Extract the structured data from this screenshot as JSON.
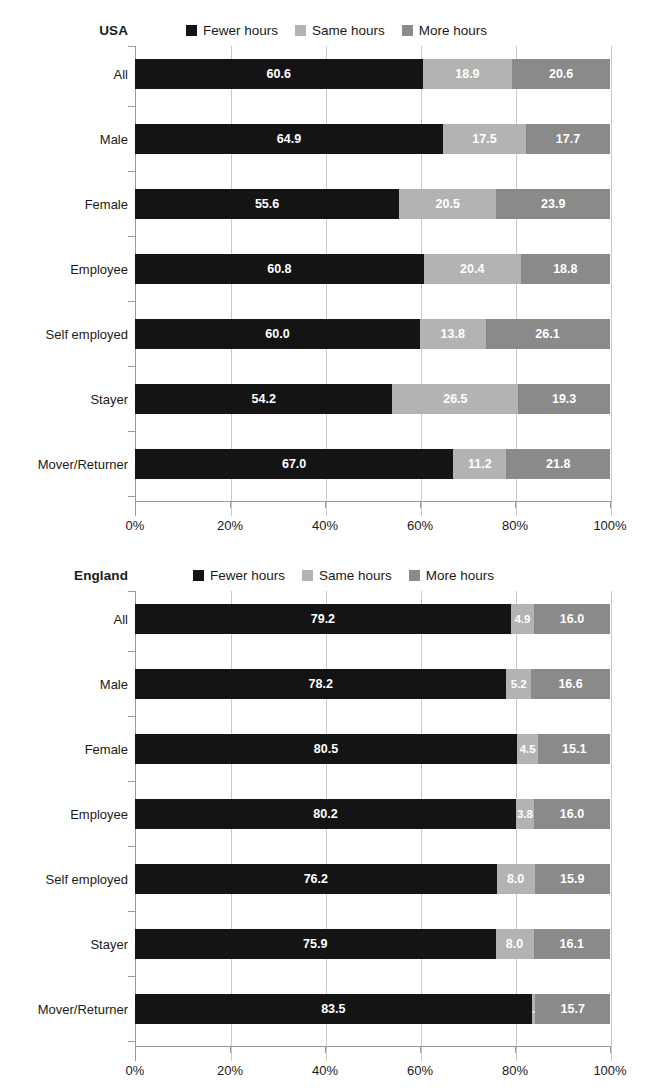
{
  "charts": [
    {
      "id": "usa",
      "title": "USA",
      "legend": [
        {
          "label": "Fewer hours",
          "color": "#141414"
        },
        {
          "label": "Same hours",
          "color": "#b3b3b3"
        },
        {
          "label": "More hours",
          "color": "#8a8a8a"
        }
      ],
      "categories": [
        "All",
        "Male",
        "Female",
        "Employee",
        "Self employed",
        "Stayer",
        "Mover/Returner"
      ],
      "xticks": [
        "0%",
        "20%",
        "40%",
        "60%",
        "80%",
        "100%"
      ]
    },
    {
      "id": "england",
      "title": "England",
      "legend": [
        {
          "label": "Fewer hours",
          "color": "#141414"
        },
        {
          "label": "Same hours",
          "color": "#b3b3b3"
        },
        {
          "label": "More hours",
          "color": "#8a8a8a"
        }
      ],
      "categories": [
        "All",
        "Male",
        "Female",
        "Employee",
        "Self employed",
        "Stayer",
        "Mover/Returner"
      ],
      "xticks": [
        "0%",
        "20%",
        "40%",
        "60%",
        "80%",
        "100%"
      ]
    }
  ],
  "chart_data": [
    {
      "type": "bar",
      "orientation": "horizontal",
      "stacked": true,
      "normalized_percent": true,
      "title": "USA",
      "xlabel": "",
      "ylabel": "",
      "xlim": [
        0,
        100
      ],
      "xticks": [
        0,
        20,
        40,
        60,
        80,
        100
      ],
      "xticklabels": [
        "0%",
        "20%",
        "40%",
        "60%",
        "80%",
        "100%"
      ],
      "grid": "vertical",
      "legend_position": "top",
      "categories": [
        "All",
        "Male",
        "Female",
        "Employee",
        "Self employed",
        "Stayer",
        "Mover/Returner"
      ],
      "series": [
        {
          "name": "Fewer hours",
          "color": "#141414",
          "values": [
            60.6,
            64.9,
            55.6,
            60.8,
            60.0,
            54.2,
            67.0
          ]
        },
        {
          "name": "Same hours",
          "color": "#b3b3b3",
          "values": [
            18.9,
            17.5,
            20.5,
            20.4,
            13.8,
            26.5,
            11.2
          ]
        },
        {
          "name": "More hours",
          "color": "#8a8a8a",
          "values": [
            20.6,
            17.7,
            23.9,
            18.8,
            26.1,
            19.3,
            21.8
          ]
        }
      ]
    },
    {
      "type": "bar",
      "orientation": "horizontal",
      "stacked": true,
      "normalized_percent": true,
      "title": "England",
      "xlabel": "",
      "ylabel": "",
      "xlim": [
        0,
        100
      ],
      "xticks": [
        0,
        20,
        40,
        60,
        80,
        100
      ],
      "xticklabels": [
        "0%",
        "20%",
        "40%",
        "60%",
        "80%",
        "100%"
      ],
      "grid": "vertical",
      "legend_position": "top",
      "categories": [
        "All",
        "Male",
        "Female",
        "Employee",
        "Self employed",
        "Stayer",
        "Mover/Returner"
      ],
      "series": [
        {
          "name": "Fewer hours",
          "color": "#141414",
          "values": [
            79.2,
            78.2,
            80.5,
            80.2,
            76.2,
            75.9,
            83.5
          ]
        },
        {
          "name": "Same hours",
          "color": "#b3b3b3",
          "values": [
            4.9,
            5.2,
            4.5,
            3.8,
            8.0,
            8.0,
            0.8
          ]
        },
        {
          "name": "More hours",
          "color": "#8a8a8a",
          "values": [
            16.0,
            16.6,
            15.1,
            16.0,
            15.9,
            16.1,
            15.7
          ]
        }
      ]
    }
  ]
}
